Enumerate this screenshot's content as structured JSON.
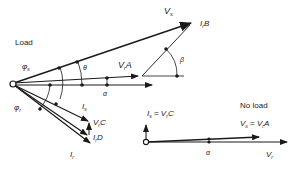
{
  "diagram": {
    "colors": {
      "line": "#1a1a1a",
      "background": "#ffffff"
    },
    "load": {
      "label": "Load",
      "phasors": {
        "Vs": {
          "main": "V",
          "sub": "s"
        },
        "IrB": {
          "main": "I",
          "sub": "r",
          "suffix": "B"
        },
        "VrA": {
          "main": "V",
          "sub": "r",
          "suffix": "A"
        },
        "Vr_axis": {
          "main": "",
          "sub": ""
        },
        "Is": {
          "main": "I",
          "sub": "s"
        },
        "VrC": {
          "main": "V",
          "sub": "r",
          "suffix": "C"
        },
        "IrD": {
          "main": "I",
          "sub": "r",
          "suffix": "D"
        },
        "Ir": {
          "main": "I",
          "sub": "r"
        }
      },
      "angles": {
        "phi_s": {
          "main": "φ",
          "sub": "s"
        },
        "phi_r": {
          "main": "φ",
          "sub": "r"
        },
        "theta": "θ",
        "alpha": "α",
        "beta": "β"
      }
    },
    "no_load": {
      "label": "No load",
      "eq1": {
        "l_main": "I",
        "l_sub": "s",
        "eq": " = ",
        "r_main": "V",
        "r_sub": "r",
        "r_suffix": "C"
      },
      "eq2": {
        "l_main": "V",
        "l_sub": "s",
        "eq": " = ",
        "r_main": "V",
        "r_sub": "r",
        "r_suffix": "A"
      },
      "alpha": "α",
      "Vr": {
        "main": "V",
        "sub": "r"
      }
    }
  }
}
